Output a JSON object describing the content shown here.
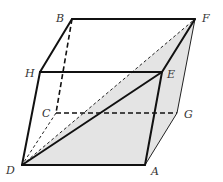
{
  "figure": {
    "type": "parallelepiped",
    "shade_color": "#e4e4e4",
    "vertices": {
      "A": {
        "label": "A",
        "x": 145,
        "y": 165,
        "lx": 151,
        "ly": 175
      },
      "B": {
        "label": "B",
        "x": 72,
        "y": 19,
        "lx": 56,
        "ly": 22
      },
      "C": {
        "label": "C",
        "x": 56,
        "y": 113,
        "lx": 42,
        "ly": 117
      },
      "D": {
        "label": "D",
        "x": 22,
        "y": 165,
        "lx": 6,
        "ly": 174
      },
      "E": {
        "label": "E",
        "x": 162,
        "y": 72,
        "lx": 167,
        "ly": 78
      },
      "F": {
        "label": "F",
        "x": 195,
        "y": 19,
        "lx": 202,
        "ly": 22
      },
      "G": {
        "label": "G",
        "x": 177,
        "y": 113,
        "lx": 184,
        "ly": 118
      },
      "H": {
        "label": "H",
        "x": 40,
        "y": 72,
        "lx": 25,
        "ly": 77
      }
    },
    "shaded_plane": [
      "D",
      "A",
      "G",
      "F"
    ],
    "edges": [
      {
        "from": "D",
        "to": "A",
        "style": "solid"
      },
      {
        "from": "D",
        "to": "H",
        "style": "solid"
      },
      {
        "from": "H",
        "to": "E",
        "style": "solid"
      },
      {
        "from": "E",
        "to": "A",
        "style": "solid"
      },
      {
        "from": "H",
        "to": "B",
        "style": "solid"
      },
      {
        "from": "B",
        "to": "F",
        "style": "solid"
      },
      {
        "from": "E",
        "to": "F",
        "style": "solid"
      },
      {
        "from": "D",
        "to": "E",
        "style": "solid"
      },
      {
        "from": "A",
        "to": "G",
        "style": "thin"
      },
      {
        "from": "G",
        "to": "F",
        "style": "thin"
      },
      {
        "from": "B",
        "to": "C",
        "style": "dashed"
      },
      {
        "from": "C",
        "to": "G",
        "style": "dashed"
      },
      {
        "from": "C",
        "to": "D",
        "style": "dashed-thin"
      },
      {
        "from": "D",
        "to": "F",
        "style": "dashed-thin"
      }
    ]
  }
}
